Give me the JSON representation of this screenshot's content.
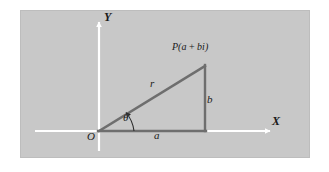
{
  "figure": {
    "type": "complex-plane-polar-form-diagram",
    "panel": {
      "background_color": "#c8c8c8",
      "border_color": "#bdbdbd"
    },
    "colors": {
      "axis": "#ffffff",
      "triangle": "#6e6e6e",
      "text": "#1a1a1a"
    },
    "axes": {
      "x_label": "X",
      "y_label": "Y",
      "origin_label": "O"
    },
    "labels": {
      "point": "P(a + bi)",
      "point_prefix": "P(",
      "point_real": "a",
      "point_plus": " + ",
      "point_imag": "bi",
      "point_suffix": ")",
      "hypotenuse": "r",
      "opposite": "b",
      "adjacent": "a",
      "angle": "θ"
    },
    "geometry": {
      "origin": {
        "x": 99,
        "y": 131
      },
      "point_P": {
        "x": 205,
        "y": 66
      },
      "foot": {
        "x": 205,
        "y": 131
      },
      "x_axis": {
        "x1": 35,
        "y1": 131,
        "x2": 272,
        "y2": 131
      },
      "y_axis": {
        "x1": 99,
        "y1": 150,
        "x2": 99,
        "y2": 20
      },
      "angle_degrees": 31
    }
  }
}
